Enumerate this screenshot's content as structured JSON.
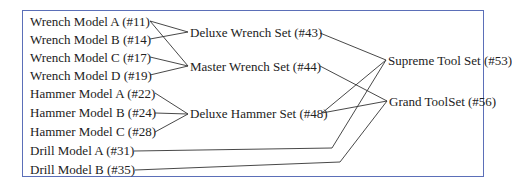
{
  "diagram": {
    "type": "bill-of-materials-tree",
    "colors": {
      "border": "#5b6fb8",
      "line": "#333333",
      "text": "#222222"
    },
    "components": [
      {
        "id": "w11",
        "label": "Wrench Model A (#11)"
      },
      {
        "id": "w14",
        "label": "Wrench Model B (#14)"
      },
      {
        "id": "w17",
        "label": "Wrench Model C (#17)"
      },
      {
        "id": "w19",
        "label": "Wrench Model D (#19)"
      },
      {
        "id": "h22",
        "label": "Hammer Model A (#22)"
      },
      {
        "id": "h24",
        "label": "Hammer Model B (#24)"
      },
      {
        "id": "h28",
        "label": "Hammer Model C (#28)"
      },
      {
        "id": "d31",
        "label": "Drill Model A (#31)"
      },
      {
        "id": "d35",
        "label": "Drill Model B (#35)"
      }
    ],
    "subassemblies": [
      {
        "id": "s43",
        "label": "Deluxe Wrench Set (#43)"
      },
      {
        "id": "s44",
        "label": "Master Wrench Set (#44)"
      },
      {
        "id": "s48",
        "label": "Deluxe Hammer Set (#48)"
      }
    ],
    "products": [
      {
        "id": "p53",
        "label": "Supreme Tool Set (#53)"
      },
      {
        "id": "p56",
        "label": "Grand ToolSet (#56)"
      }
    ],
    "edges": [
      [
        "w11",
        "s43"
      ],
      [
        "w14",
        "s43"
      ],
      [
        "w11",
        "s44"
      ],
      [
        "w17",
        "s44"
      ],
      [
        "w19",
        "s44"
      ],
      [
        "h22",
        "s48"
      ],
      [
        "h24",
        "s48"
      ],
      [
        "h28",
        "s48"
      ],
      [
        "s43",
        "p53"
      ],
      [
        "s48",
        "p53"
      ],
      [
        "d31",
        "p53"
      ],
      [
        "s44",
        "p56"
      ],
      [
        "s48",
        "p56"
      ],
      [
        "d35",
        "p56"
      ]
    ]
  }
}
